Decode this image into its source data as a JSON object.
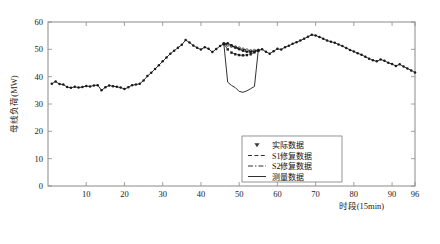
{
  "chart_data": {
    "type": "line",
    "title": "",
    "xlabel": "时段(15min)",
    "ylabel": "母线负荷(MW)",
    "xlim": [
      0,
      96
    ],
    "ylim": [
      0,
      60
    ],
    "xticks": [
      10,
      20,
      30,
      40,
      50,
      60,
      70,
      80,
      90,
      96
    ],
    "yticks": [
      0,
      10,
      20,
      30,
      40,
      50,
      60
    ],
    "grid": false,
    "legend_position": "lower-right-inside",
    "legend": [
      {
        "label": "实际数据",
        "style": "marker-only",
        "marker": "triangle-down"
      },
      {
        "label": "S1修复数据",
        "style": "dashed"
      },
      {
        "label": "S2修复数据",
        "style": "dash-dot"
      },
      {
        "label": "测量数据",
        "style": "solid"
      }
    ],
    "series": [
      {
        "name": "实际数据",
        "style": "solid-marker",
        "x": [
          1,
          2,
          3,
          4,
          5,
          6,
          7,
          8,
          9,
          10,
          11,
          12,
          13,
          14,
          15,
          16,
          17,
          18,
          19,
          20,
          21,
          22,
          23,
          24,
          25,
          26,
          27,
          28,
          29,
          30,
          31,
          32,
          33,
          34,
          35,
          36,
          37,
          38,
          39,
          40,
          41,
          42,
          43,
          44,
          45,
          46,
          47,
          48,
          49,
          50,
          51,
          52,
          53,
          54,
          55,
          56,
          57,
          58,
          59,
          60,
          61,
          62,
          63,
          64,
          65,
          66,
          67,
          68,
          69,
          70,
          71,
          72,
          73,
          74,
          75,
          76,
          77,
          78,
          79,
          80,
          81,
          82,
          83,
          84,
          85,
          86,
          87,
          88,
          89,
          90,
          91,
          92,
          93,
          94,
          95,
          96
        ],
        "y": [
          37.4,
          38.2,
          37.3,
          37.1,
          36.2,
          35.9,
          36.3,
          36.0,
          36.2,
          36.6,
          36.4,
          36.8,
          36.9,
          35.0,
          36.1,
          36.8,
          36.5,
          36.3,
          36.0,
          35.5,
          36.1,
          36.9,
          37.1,
          37.4,
          38.6,
          40.2,
          41.4,
          42.8,
          44.2,
          45.6,
          47.0,
          48.4,
          49.5,
          50.6,
          51.7,
          53.4,
          52.5,
          51.4,
          50.6,
          49.9,
          50.8,
          50.2,
          49.0,
          50.1,
          51.2,
          52.0,
          52.2,
          51.5,
          50.7,
          50.0,
          49.5,
          49.1,
          49.0,
          49.2,
          49.6,
          50.0,
          49.1,
          48.4,
          49.3,
          50.2,
          49.9,
          50.8,
          51.3,
          52.0,
          52.6,
          53.2,
          53.9,
          54.6,
          55.3,
          55.1,
          54.5,
          53.9,
          53.2,
          52.8,
          52.4,
          51.8,
          51.2,
          50.5,
          49.8,
          49.2,
          48.6,
          48.0,
          47.3,
          46.6,
          46.0,
          45.6,
          46.3,
          45.8,
          45.1,
          44.6,
          43.9,
          44.5,
          43.7,
          43.0,
          42.3,
          41.5
        ]
      },
      {
        "name": "S1修复数据",
        "style": "dashed",
        "x": [
          46,
          47,
          48,
          49,
          50,
          51,
          52,
          53,
          54,
          55
        ],
        "y": [
          52.0,
          51.6,
          51.2,
          50.8,
          50.4,
          50.0,
          49.7,
          49.4,
          49.5,
          49.6
        ]
      },
      {
        "name": "S2修复数据",
        "style": "dash-dot",
        "x": [
          46,
          47,
          48,
          49,
          50,
          51,
          52,
          53,
          54,
          55
        ],
        "y": [
          52.0,
          50.0,
          48.8,
          48.2,
          47.9,
          47.8,
          47.9,
          48.2,
          48.9,
          49.6
        ]
      },
      {
        "name": "测量数据",
        "style": "solid",
        "x": [
          46,
          47,
          48,
          49,
          50,
          51,
          52,
          53,
          54,
          55
        ],
        "y": [
          52.0,
          38.0,
          36.8,
          36.0,
          34.6,
          34.3,
          34.8,
          35.6,
          36.4,
          49.6
        ]
      }
    ]
  }
}
